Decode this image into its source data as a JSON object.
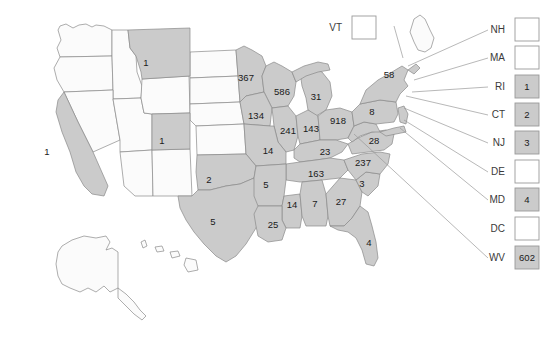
{
  "figure": {
    "type": "choropleth-map",
    "region": "United States",
    "background_color": "#ffffff",
    "shaded_fill": "#cbcbcb",
    "unshaded_fill": "#fbfbfb",
    "border_color": "#8a8a8a",
    "leader_line_color": "#9a9a9a"
  },
  "chart_data": {
    "type": "heatmap",
    "title": "",
    "xlabel": "",
    "ylabel": "",
    "legend_position": "none",
    "grid": false,
    "categories": [
      "CA",
      "MT",
      "CO",
      "MN",
      "WI",
      "MI",
      "IA",
      "IL",
      "IN",
      "OH",
      "MO",
      "KY",
      "TN",
      "OK",
      "TX",
      "AR",
      "MS",
      "AL",
      "GA",
      "SC",
      "LA",
      "FL",
      "NC",
      "VA",
      "PA",
      "NY",
      "RI",
      "CT",
      "NJ",
      "MD",
      "WV",
      "VT",
      "NH",
      "MA",
      "DE",
      "DC"
    ],
    "values": [
      1,
      1,
      1,
      367,
      586,
      31,
      134,
      241,
      143,
      918,
      14,
      23,
      163,
      2,
      5,
      5,
      14,
      7,
      27,
      3,
      25,
      4,
      237,
      28,
      8,
      58,
      1,
      2,
      3,
      4,
      602,
      null,
      null,
      null,
      null,
      null
    ]
  },
  "map_states": {
    "shaded": [
      {
        "code": "CA",
        "value": "1",
        "x": 47,
        "y": 152
      },
      {
        "code": "MT",
        "value": "1",
        "x": 146,
        "y": 63
      },
      {
        "code": "CO",
        "value": "1",
        "x": 162,
        "y": 141
      },
      {
        "code": "MN",
        "value": "367",
        "x": 246,
        "y": 78
      },
      {
        "code": "WI",
        "value": "586",
        "x": 282,
        "y": 92
      },
      {
        "code": "MI",
        "value": "31",
        "x": 316,
        "y": 97
      },
      {
        "code": "IA",
        "value": "134",
        "x": 256,
        "y": 116
      },
      {
        "code": "IL",
        "value": "241",
        "x": 288,
        "y": 131
      },
      {
        "code": "IN",
        "value": "143",
        "x": 311,
        "y": 129
      },
      {
        "code": "OH",
        "value": "918",
        "x": 338,
        "y": 121
      },
      {
        "code": "MO",
        "value": "14",
        "x": 268,
        "y": 151
      },
      {
        "code": "KY",
        "value": "23",
        "x": 325,
        "y": 152
      },
      {
        "code": "TN",
        "value": "163",
        "x": 316,
        "y": 174
      },
      {
        "code": "OK",
        "value": "2",
        "x": 209,
        "y": 180
      },
      {
        "code": "TX",
        "value": "5",
        "x": 213,
        "y": 222
      },
      {
        "code": "AR",
        "value": "5",
        "x": 266,
        "y": 185
      },
      {
        "code": "MS",
        "value": "14",
        "x": 292,
        "y": 205
      },
      {
        "code": "AL",
        "value": "7",
        "x": 315,
        "y": 204
      },
      {
        "code": "GA",
        "value": "27",
        "x": 341,
        "y": 202
      },
      {
        "code": "SC",
        "value": "3",
        "x": 362,
        "y": 184
      },
      {
        "code": "LA",
        "value": "25",
        "x": 273,
        "y": 225
      },
      {
        "code": "FL",
        "value": "4",
        "x": 369,
        "y": 243
      },
      {
        "code": "NC",
        "value": "237",
        "x": 363,
        "y": 163
      },
      {
        "code": "VA",
        "value": "28",
        "x": 374,
        "y": 141
      },
      {
        "code": "PA",
        "value": "8",
        "x": 372,
        "y": 112
      },
      {
        "code": "NY",
        "value": "58",
        "x": 389,
        "y": 75
      }
    ],
    "unshaded": [
      "WA",
      "OR",
      "ID",
      "WY",
      "NV",
      "UT",
      "AZ",
      "NM",
      "ND",
      "SD",
      "NE",
      "KS",
      "AK",
      "HI",
      "ME"
    ]
  },
  "callouts": [
    {
      "code": "VT",
      "value": "",
      "shaded": false,
      "label_x": 342,
      "label_y": 28,
      "box_x": 352,
      "box_y": 16
    },
    {
      "code": "NH",
      "value": "",
      "shaded": false,
      "label_x": 505,
      "label_y": 30,
      "box_x": 515,
      "box_y": 18
    },
    {
      "code": "MA",
      "value": "",
      "shaded": false,
      "label_x": 505,
      "label_y": 58,
      "box_x": 515,
      "box_y": 46
    },
    {
      "code": "RI",
      "value": "1",
      "shaded": true,
      "label_x": 505,
      "label_y": 87,
      "box_x": 515,
      "box_y": 75
    },
    {
      "code": "CT",
      "value": "2",
      "shaded": true,
      "label_x": 505,
      "label_y": 115,
      "box_x": 515,
      "box_y": 103
    },
    {
      "code": "NJ",
      "value": "3",
      "shaded": true,
      "label_x": 505,
      "label_y": 143,
      "box_x": 515,
      "box_y": 131
    },
    {
      "code": "DE",
      "value": "",
      "shaded": false,
      "label_x": 505,
      "label_y": 172,
      "box_x": 515,
      "box_y": 160
    },
    {
      "code": "MD",
      "value": "4",
      "shaded": true,
      "label_x": 505,
      "label_y": 200,
      "box_x": 515,
      "box_y": 188
    },
    {
      "code": "DC",
      "value": "",
      "shaded": false,
      "label_x": 505,
      "label_y": 229,
      "box_x": 515,
      "box_y": 217
    },
    {
      "code": "WV",
      "value": "602",
      "shaded": true,
      "label_x": 505,
      "label_y": 258,
      "box_x": 515,
      "box_y": 246
    }
  ]
}
